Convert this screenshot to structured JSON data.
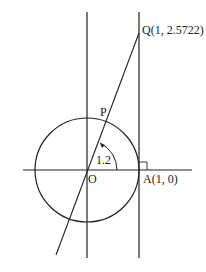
{
  "diagram": {
    "type": "unit-circle-tangent",
    "labels": {
      "Q": "Q(1, 2.5722)",
      "P": "P",
      "O": "O",
      "A": "A(1, 0)",
      "angle": "1.2"
    },
    "colors": {
      "stroke": "#222222",
      "background": "#ffffff"
    },
    "geometry": {
      "origin": [
        87,
        170
      ],
      "radius": 52,
      "tangent_x": 139,
      "Q_point": [
        139,
        33
      ],
      "angle_radians": 1.2
    }
  }
}
